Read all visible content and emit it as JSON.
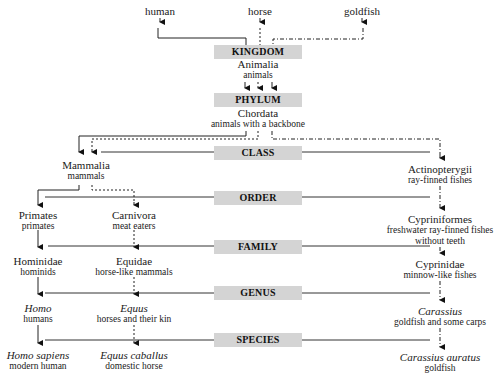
{
  "organisms": [
    {
      "label": "human",
      "x": 160,
      "line": "solid"
    },
    {
      "label": "horse",
      "x": 260,
      "line": "dotted"
    },
    {
      "label": "goldfish",
      "x": 362,
      "line": "dash-dot"
    }
  ],
  "ranks": [
    {
      "label": "KINGDOM",
      "y": 45
    },
    {
      "label": "PHYLUM",
      "y": 93
    },
    {
      "label": "CLASS",
      "y": 146
    },
    {
      "label": "ORDER",
      "y": 191
    },
    {
      "label": "FAMILY",
      "y": 240
    },
    {
      "label": "GENUS",
      "y": 286
    },
    {
      "label": "SPECIES",
      "y": 333
    }
  ],
  "shared": {
    "kingdom": {
      "name": "Animalia",
      "common": "animals"
    },
    "phylum": {
      "name": "Chordata",
      "common": "animals with a backbone"
    }
  },
  "human": {
    "class": {
      "name": "Mammalia",
      "common": "mammals"
    },
    "order": {
      "name": "Primates",
      "common": "primates"
    },
    "family": {
      "name": "Hominidae",
      "common": "hominids"
    },
    "genus": {
      "name": "Homo",
      "common": "humans"
    },
    "species": {
      "name": "Homo sapiens",
      "common": "modern human"
    }
  },
  "horse": {
    "order": {
      "name": "Carnivora",
      "common": "meat eaters"
    },
    "family": {
      "name": "Equidae",
      "common": "horse-like mammals"
    },
    "genus": {
      "name": "Equus",
      "common": "horses and their kin"
    },
    "species": {
      "name": "Equus caballus",
      "common": "domestic horse"
    }
  },
  "goldfish": {
    "class": {
      "name": "Actinopterygii",
      "common": "ray-finned fishes"
    },
    "order": {
      "name": "Cypriniformes",
      "common": "freshwater ray-finned fishes",
      "common2": "without teeth"
    },
    "family": {
      "name": "Cyprinidae",
      "common": "minnow-like fishes"
    },
    "genus": {
      "name": "Carassius",
      "common": "goldfish and some carps"
    },
    "species": {
      "name": "Carassius auratus",
      "common": "goldfish"
    }
  },
  "colors": {
    "rank_bar": "#d4d4d4",
    "line": "#222222",
    "background": "#ffffff"
  }
}
